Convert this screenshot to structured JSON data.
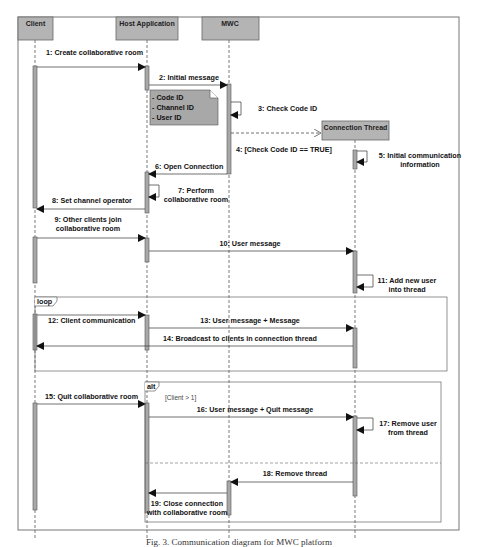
{
  "diagram": {
    "type": "sequence",
    "lifelines": [
      {
        "id": "client",
        "label": "Client"
      },
      {
        "id": "host",
        "label": "Host Application"
      },
      {
        "id": "mwc",
        "label": "MWC"
      },
      {
        "id": "thread",
        "label": "Connection Thread"
      }
    ],
    "note": {
      "lines": [
        "- Code ID",
        "- Channel ID",
        "- User ID"
      ]
    },
    "messages": [
      {
        "n": 1,
        "label": "1: Create collaborative room",
        "from": "client",
        "to": "host"
      },
      {
        "n": 2,
        "label": "2: Initial message",
        "from": "host",
        "to": "mwc"
      },
      {
        "n": 3,
        "label": "3: Check Code ID",
        "from": "mwc",
        "to": "mwc"
      },
      {
        "n": 4,
        "label": "4: [Check Code ID == TRUE]",
        "from": "mwc",
        "to": "thread",
        "style": "create-dashed"
      },
      {
        "n": 5,
        "label_lines": [
          "5: Initial communication",
          "information"
        ],
        "from": "thread",
        "to": "thread"
      },
      {
        "n": 6,
        "label": "6: Open Connection",
        "from": "mwc",
        "to": "host"
      },
      {
        "n": 7,
        "label_lines": [
          "7: Perform",
          "collaborative room"
        ],
        "from": "host",
        "to": "host"
      },
      {
        "n": 8,
        "label": "8: Set channel operator",
        "from": "host",
        "to": "client"
      },
      {
        "n": 9,
        "label_lines": [
          "9: Other clients join",
          "collaborative room"
        ],
        "from": "client",
        "to": "host"
      },
      {
        "n": 10,
        "label": "10: User message",
        "from": "host",
        "to": "thread"
      },
      {
        "n": 11,
        "label_lines": [
          "11: Add new user",
          "into thread"
        ],
        "from": "thread",
        "to": "thread"
      },
      {
        "n": 12,
        "label": "12: Client communication",
        "from": "client",
        "to": "host"
      },
      {
        "n": 13,
        "label": "13: User message + Message",
        "from": "host",
        "to": "thread"
      },
      {
        "n": 14,
        "label": "14: Broadcast to clients in connection thread",
        "from": "thread",
        "to": "client"
      },
      {
        "n": 15,
        "label": "15: Quit collaborative room",
        "from": "client",
        "to": "host"
      },
      {
        "n": 16,
        "label": "16: User message + Quit message",
        "from": "host",
        "to": "thread"
      },
      {
        "n": 17,
        "label_lines": [
          "17: Remove user",
          "from thread"
        ],
        "from": "thread",
        "to": "thread"
      },
      {
        "n": 18,
        "label": "18: Remove thread",
        "from": "thread",
        "to": "mwc"
      },
      {
        "n": 19,
        "label_lines": [
          "19: Close connection",
          "with collaborative room"
        ],
        "from": "mwc",
        "to": "host"
      }
    ],
    "fragments": [
      {
        "kind": "loop",
        "label": "loop"
      },
      {
        "kind": "alt",
        "label": "alt",
        "guard": "[Client > 1]"
      }
    ],
    "caption": "Fig. 3. Communication diagram for MWC platform"
  },
  "colors": {
    "header_fill": "#b4b4b4",
    "activation_fill": "#a8a8a8",
    "line": "#333333",
    "frame": "#666666"
  }
}
